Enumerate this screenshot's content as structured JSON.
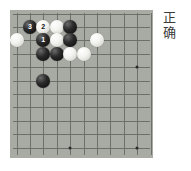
{
  "caption": {
    "lines": [
      "正",
      "确"
    ],
    "text": "正确"
  },
  "board": {
    "name": "go-board",
    "background_color": "#a8aba3",
    "line_color": "#6d7069",
    "cols": 11,
    "rows": 11,
    "spacing": 13.4,
    "origin_x": 6.5,
    "origin_y": 3.5,
    "star_points": [
      [
        9,
        4
      ],
      [
        4,
        10
      ],
      [
        9,
        10
      ]
    ],
    "stones": [
      {
        "col": 1,
        "row": 1,
        "color": "black",
        "label": "3"
      },
      {
        "col": 2,
        "row": 1,
        "color": "white",
        "label": "2"
      },
      {
        "col": 3,
        "row": 1,
        "color": "white",
        "label": ""
      },
      {
        "col": 4,
        "row": 1,
        "color": "black",
        "label": ""
      },
      {
        "col": 0,
        "row": 2,
        "color": "white",
        "label": ""
      },
      {
        "col": 2,
        "row": 2,
        "color": "black",
        "label": "1"
      },
      {
        "col": 3,
        "row": 2,
        "color": "white",
        "label": ""
      },
      {
        "col": 4,
        "row": 2,
        "color": "black",
        "label": ""
      },
      {
        "col": 6,
        "row": 2,
        "color": "white",
        "label": ""
      },
      {
        "col": 2,
        "row": 3,
        "color": "black",
        "label": ""
      },
      {
        "col": 3,
        "row": 3,
        "color": "black",
        "label": ""
      },
      {
        "col": 4,
        "row": 3,
        "color": "white",
        "label": ""
      },
      {
        "col": 5,
        "row": 3,
        "color": "white",
        "label": ""
      },
      {
        "col": 2,
        "row": 5,
        "color": "black",
        "label": ""
      }
    ]
  }
}
